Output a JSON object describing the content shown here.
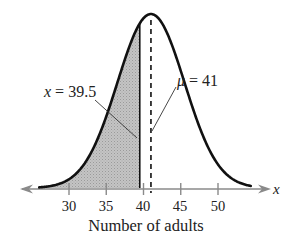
{
  "chart_data": {
    "type": "area",
    "title": "",
    "xlabel": "Number of adults",
    "ylabel": "",
    "axis_variable": "x",
    "x_ticks": [
      30,
      35,
      40,
      45,
      50
    ],
    "xlim": [
      23,
      55
    ],
    "distribution": "normal",
    "mean": 41,
    "std_dev_approx": 4.5,
    "shaded_region": {
      "from": "-inf",
      "to": 39.5,
      "description": "area left of x = 39.5"
    },
    "annotations": [
      {
        "text": "x = 39.5",
        "points_to": 39.5
      },
      {
        "text": "μ = 41",
        "points_to": 41,
        "line_style": "dashed vertical at mean"
      }
    ],
    "grid": false,
    "legend": null
  },
  "labels": {
    "x_annotation_var": "x",
    "x_annotation_rest": " = 39.5",
    "mu_annotation_var": "μ",
    "mu_annotation_rest": " = 41",
    "axis_var": "x",
    "xlabel": "Number of adults",
    "ticks": [
      "30",
      "35",
      "40",
      "45",
      "50"
    ]
  },
  "colors": {
    "curve": "#111111",
    "shade": "#bdbdbd",
    "axis": "#8a8a8a",
    "text": "#222222"
  }
}
